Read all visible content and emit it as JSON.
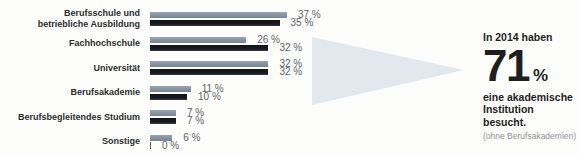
{
  "chart_data": {
    "type": "bar",
    "orientation": "horizontal",
    "categories": [
      "Berufsschule und\nbetriebliche Ausbildung",
      "Fachhochschule",
      "Universität",
      "Berufsakademie",
      "Berufsbegleitendes Studium",
      "Sonstige"
    ],
    "series": [
      {
        "name": "upper-gray-bar",
        "color_top": "#9aa6b2",
        "color": "#8391a0",
        "values": [
          37,
          26,
          32,
          11,
          7,
          6
        ]
      },
      {
        "name": "lower-black-bar",
        "color_top": "#101216",
        "color": "#1a1d22",
        "values": [
          35,
          32,
          32,
          10,
          7,
          0
        ]
      }
    ],
    "value_suffix": " %",
    "xlim": [
      0,
      40
    ],
    "grid": false,
    "legend": false
  },
  "callout": {
    "intro": "In 2014 haben",
    "big_number": "71",
    "percent_sign": "%",
    "description": "eine akademische\nInstitution besucht.",
    "note": "(ohne Berufsakademien)",
    "arrow_color": "#e1e9ee"
  },
  "colors": {
    "background": "#fdfdfc",
    "category_label": "#2b2d2f",
    "value_label": "#5c6268",
    "bar_gray": "#8391a0",
    "bar_black": "#1a1d22"
  }
}
